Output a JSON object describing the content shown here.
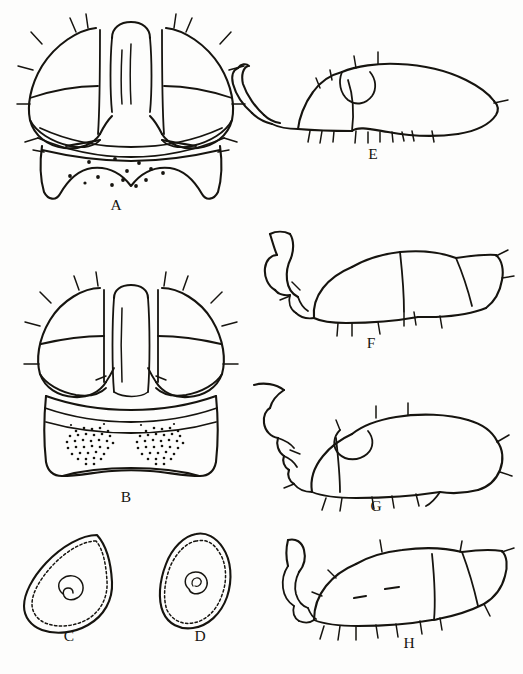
{
  "plate": {
    "title": "Morphological plate A–H",
    "background_color": "#fdfdfc",
    "ink_color": "#16140f",
    "width": 523,
    "height": 674,
    "panel_count": 8
  },
  "panels": [
    {
      "id": "A",
      "label": "A",
      "label_x": 116,
      "label_y": 210,
      "view": "dorsal-head",
      "description": "Dorsal view of head with paired lateral eyes, central frontal ridge and shield-shaped lower plate bearing scattered punctures",
      "surface_marking": "scattered-punctures",
      "marking_count": 13,
      "column": "left"
    },
    {
      "id": "B",
      "label": "B",
      "label_x": 126,
      "label_y": 502,
      "view": "dorsal-head",
      "description": "Dorsal view of head with paired lateral eyes, central frontal ridge and squared lower plate bearing two dense stippled patches",
      "surface_marking": "paired-stipple-patches",
      "marking_count": 2,
      "column": "left"
    },
    {
      "id": "C",
      "label": "C",
      "label_x": 69,
      "label_y": 641,
      "view": "scale-outline",
      "description": "Teardrop-shaped scale in outline with dashed inner margin and central spiral mark",
      "surface_marking": "central-spiral",
      "column": "left"
    },
    {
      "id": "D",
      "label": "D",
      "label_x": 200,
      "label_y": 641,
      "view": "scale-outline",
      "description": "Oval scale in outline with dashed inner margin and central spiral mark",
      "surface_marking": "central-spiral",
      "column": "left"
    },
    {
      "id": "E",
      "label": "E",
      "label_x": 373,
      "label_y": 159,
      "view": "lateral-body",
      "description": "Lateral view with pointed spindle-shaped terminal segment, curved basal appendage and ventral setae",
      "terminal_shape": "pointed-spindle",
      "column": "right"
    },
    {
      "id": "F",
      "label": "F",
      "label_x": 371,
      "label_y": 348,
      "view": "lateral-body",
      "description": "Lateral view with blunt angular terminal segment and hooked basal appendage",
      "terminal_shape": "blunt-angular",
      "column": "right"
    },
    {
      "id": "G",
      "label": "G",
      "label_x": 376,
      "label_y": 511,
      "view": "lateral-body",
      "description": "Lateral view with broadly rounded terminal end and segmented beaded basal appendage",
      "terminal_shape": "rounded",
      "column": "right"
    },
    {
      "id": "H",
      "label": "H",
      "label_x": 409,
      "label_y": 648,
      "view": "lateral-body",
      "description": "Lateral view with angular terminal segment and two short dash marks on the body",
      "terminal_shape": "angular",
      "surface_marking": "paired-dashes",
      "marking_count": 2,
      "column": "right"
    }
  ]
}
